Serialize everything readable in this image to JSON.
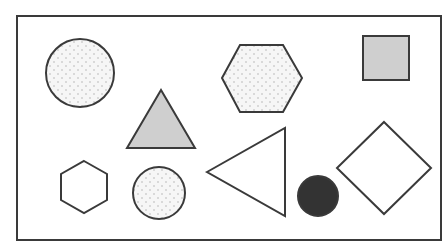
{
  "figure": {
    "colors": {
      "stroke": "#3a3a3a",
      "gray_fill": "#cfcfcf",
      "dot_fill": "#f4f4f4",
      "dot": "#b8b8b8",
      "black_fill": "#333333",
      "background": "#ffffff"
    },
    "frame": {
      "x": 17,
      "y": 16,
      "width": 424,
      "height": 224
    },
    "shapes": [
      {
        "id": "large-dotted-circle",
        "type": "circle",
        "fill": "dotted",
        "cx": 80,
        "cy": 73,
        "r": 34
      },
      {
        "id": "gray-triangle",
        "type": "triangle",
        "fill": "gray",
        "points": "161,90 127,148 195,148"
      },
      {
        "id": "dotted-hexagon",
        "type": "hexagon",
        "fill": "dotted",
        "points": "222,78 240,45 283,45 302,78 283,112 240,112"
      },
      {
        "id": "gray-square",
        "type": "square",
        "fill": "gray",
        "x": 363,
        "y": 36,
        "width": 46,
        "height": 44
      },
      {
        "id": "small-hexagon",
        "type": "hexagon",
        "fill": "none",
        "points": "84,161 107,174 107,200 84,213 61,200 61,174"
      },
      {
        "id": "small-dotted-circle",
        "type": "circle",
        "fill": "dotted",
        "cx": 159,
        "cy": 193,
        "r": 26
      },
      {
        "id": "outline-triangle",
        "type": "triangle",
        "fill": "none",
        "points": "207,172 285,128 285,216"
      },
      {
        "id": "black-circle",
        "type": "circle",
        "fill": "black",
        "cx": 318,
        "cy": 196,
        "r": 20
      },
      {
        "id": "diamond",
        "type": "diamond",
        "fill": "none",
        "points": "384,122 431,168 384,214 337,168"
      }
    ]
  }
}
